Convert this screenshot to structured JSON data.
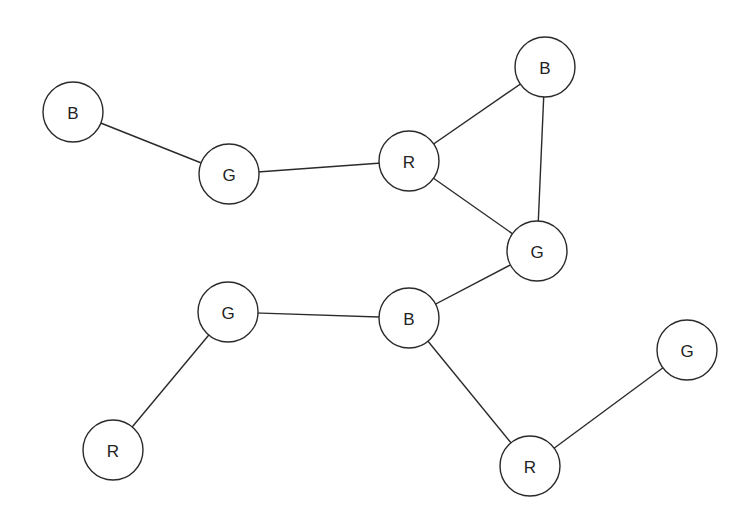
{
  "graph": {
    "title": "Graph coloring with three colors",
    "node_radius": 30,
    "nodes": [
      {
        "id": "n1",
        "label": "B",
        "x": 73,
        "y": 112
      },
      {
        "id": "n2",
        "label": "G",
        "x": 229,
        "y": 174
      },
      {
        "id": "n3",
        "label": "R",
        "x": 409,
        "y": 161
      },
      {
        "id": "n4",
        "label": "B",
        "x": 545,
        "y": 67
      },
      {
        "id": "n5",
        "label": "G",
        "x": 537,
        "y": 251
      },
      {
        "id": "n6",
        "label": "G",
        "x": 228,
        "y": 312
      },
      {
        "id": "n7",
        "label": "B",
        "x": 409,
        "y": 318
      },
      {
        "id": "n8",
        "label": "R",
        "x": 113,
        "y": 450
      },
      {
        "id": "n9",
        "label": "G",
        "x": 687,
        "y": 350
      },
      {
        "id": "n10",
        "label": "R",
        "x": 530,
        "y": 466
      }
    ],
    "edges": [
      [
        "n1",
        "n2"
      ],
      [
        "n2",
        "n3"
      ],
      [
        "n3",
        "n4"
      ],
      [
        "n3",
        "n5"
      ],
      [
        "n4",
        "n5"
      ],
      [
        "n5",
        "n7"
      ],
      [
        "n6",
        "n7"
      ],
      [
        "n6",
        "n8"
      ],
      [
        "n7",
        "n10"
      ],
      [
        "n10",
        "n9"
      ]
    ]
  }
}
